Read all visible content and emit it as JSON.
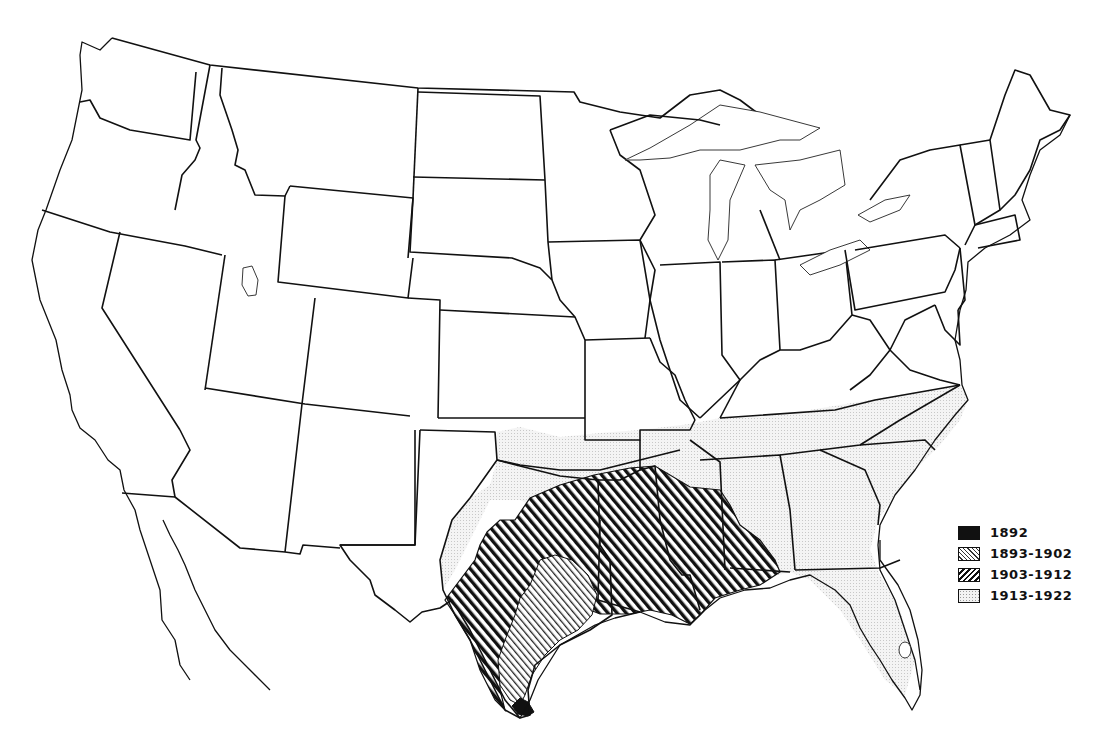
{
  "map": {
    "subject": "Outline map of the United States showing progressive spread by period",
    "background": "#ffffff",
    "line_color": "#111111"
  },
  "legend": {
    "items": [
      {
        "label": "1892",
        "pattern": "solid-black",
        "swatch_class": "solid"
      },
      {
        "label": "1893-1902",
        "pattern": "light-diagonal-hatch",
        "swatch_class": "diag-light"
      },
      {
        "label": "1903-1912",
        "pattern": "heavy-diagonal-hatch",
        "swatch_class": "diag-dark"
      },
      {
        "label": "1913-1922",
        "pattern": "fine-stipple",
        "swatch_class": "dots"
      }
    ]
  },
  "regions": [
    {
      "period": "1892",
      "area": "Southern tip of Texas near Brownsville"
    },
    {
      "period": "1893-1902",
      "area": "South-central Texas"
    },
    {
      "period": "1903-1912",
      "area": "Eastern Texas, southern Oklahoma, Arkansas, Louisiana, Mississippi, western Alabama"
    },
    {
      "period": "1913-1922",
      "area": "Oklahoma, northern Arkansas, Tennessee, Alabama, Georgia, Florida, South Carolina, North Carolina, western Texas fringe"
    }
  ]
}
